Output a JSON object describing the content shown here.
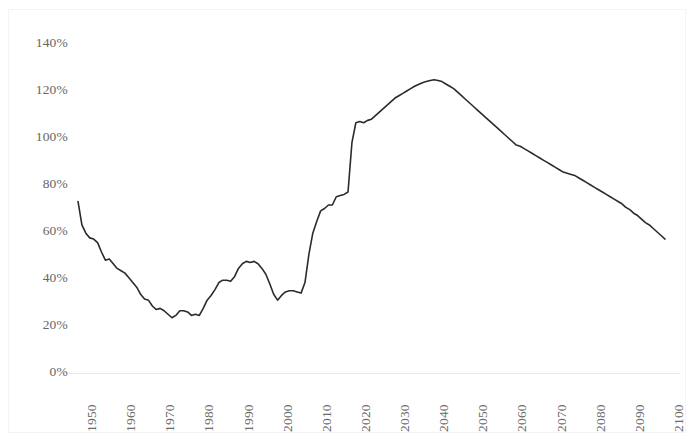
{
  "chart_data": {
    "type": "line",
    "title": "",
    "subtitle": "",
    "xlabel": "",
    "ylabel": "",
    "xlim": [
      1950,
      2100
    ],
    "ylim": [
      0,
      140
    ],
    "y_tick_labels": [
      "140%",
      "120%",
      "100%",
      "80%",
      "60%",
      "40%",
      "20%",
      "0%"
    ],
    "y_tick_values": [
      140,
      120,
      100,
      80,
      60,
      40,
      20,
      0
    ],
    "x_tick_labels": [
      "1950",
      "1960",
      "1970",
      "1980",
      "1990",
      "2000",
      "2010",
      "2020",
      "2030",
      "2040",
      "2050",
      "2060",
      "2070",
      "2080",
      "2090",
      "2100"
    ],
    "x_tick_values": [
      1950,
      1960,
      1970,
      1980,
      1990,
      2000,
      2010,
      2020,
      2030,
      2040,
      2050,
      2060,
      2070,
      2080,
      2090,
      2100
    ],
    "grid": false,
    "legend": null,
    "series": [
      {
        "name": "Debt held by the public as a percent of GDP",
        "color": "#2b2b2b",
        "line_width": 1.6,
        "x": [
          1950,
          1951,
          1952,
          1953,
          1954,
          1955,
          1956,
          1957,
          1958,
          1959,
          1960,
          1961,
          1962,
          1963,
          1964,
          1965,
          1966,
          1967,
          1968,
          1969,
          1970,
          1971,
          1972,
          1973,
          1974,
          1975,
          1976,
          1977,
          1978,
          1979,
          1980,
          1981,
          1982,
          1983,
          1984,
          1985,
          1986,
          1987,
          1988,
          1989,
          1990,
          1991,
          1992,
          1993,
          1994,
          1995,
          1996,
          1997,
          1998,
          1999,
          2000,
          2001,
          2002,
          2003,
          2004,
          2005,
          2006,
          2007,
          2008,
          2009,
          2010,
          2011,
          2012,
          2013,
          2014,
          2015,
          2016,
          2017,
          2018,
          2019,
          2020,
          2021,
          2022,
          2023,
          2024,
          2025,
          2026,
          2027,
          2028,
          2029,
          2030,
          2031,
          2032,
          2033,
          2034,
          2035,
          2036,
          2037,
          2038,
          2039,
          2040,
          2041,
          2042,
          2043,
          2044,
          2045,
          2046,
          2047,
          2048,
          2049,
          2050,
          2051,
          2052,
          2053,
          2054,
          2055,
          2056,
          2057,
          2058,
          2059,
          2060,
          2061,
          2062,
          2063,
          2064,
          2065,
          2066,
          2067,
          2068,
          2069,
          2070,
          2071,
          2072,
          2073,
          2074,
          2075,
          2076,
          2077,
          2078,
          2079,
          2080,
          2081,
          2082,
          2083,
          2084,
          2085,
          2086,
          2087,
          2088,
          2089,
          2090,
          2091,
          2092,
          2093,
          2094,
          2095,
          2096,
          2097,
          2098,
          2099,
          2100
        ],
        "y": [
          73.0,
          63.0,
          59.5,
          57.5,
          57.0,
          55.5,
          51.5,
          48.0,
          48.5,
          46.5,
          44.5,
          43.5,
          42.5,
          40.5,
          38.5,
          36.5,
          33.5,
          31.5,
          31.0,
          28.5,
          27.0,
          27.5,
          26.5,
          25.0,
          23.5,
          24.5,
          26.5,
          26.5,
          26.0,
          24.5,
          25.0,
          24.5,
          27.5,
          31.0,
          33.0,
          35.5,
          38.5,
          39.5,
          39.5,
          39.0,
          41.0,
          44.5,
          46.5,
          47.5,
          47.0,
          47.5,
          46.5,
          44.5,
          42.0,
          38.0,
          33.5,
          31.0,
          33.0,
          34.5,
          35.0,
          35.0,
          34.5,
          34.0,
          38.5,
          50.5,
          59.5,
          64.5,
          69.0,
          70.0,
          71.5,
          71.5,
          75.0,
          75.5,
          76.0,
          77.0,
          98.0,
          106.5,
          107.0,
          106.5,
          107.5,
          108.0,
          109.5,
          111.0,
          112.5,
          114.0,
          115.5,
          117.0,
          118.0,
          119.0,
          120.0,
          121.0,
          122.0,
          122.8,
          123.5,
          124.0,
          124.5,
          124.8,
          124.5,
          124.0,
          123.0,
          122.0,
          121.0,
          119.5,
          118.0,
          116.5,
          115.0,
          113.5,
          112.0,
          110.5,
          109.0,
          107.5,
          106.0,
          104.5,
          103.0,
          101.5,
          100.0,
          98.5,
          97.0,
          96.5,
          95.5,
          94.5,
          93.5,
          92.5,
          91.5,
          90.5,
          89.5,
          88.5,
          87.5,
          86.5,
          85.5,
          85.0,
          84.5,
          84.0,
          83.0,
          82.0,
          81.0,
          80.0,
          79.0,
          78.0,
          77.0,
          76.0,
          75.0,
          74.0,
          73.0,
          72.0,
          70.5,
          69.5,
          68.0,
          67.0,
          65.5,
          64.0,
          63.0,
          61.5,
          60.0,
          58.5,
          57.0
        ]
      }
    ]
  },
  "axes": {
    "y_axis_name": "y-axis",
    "x_axis_name": "x-axis"
  }
}
